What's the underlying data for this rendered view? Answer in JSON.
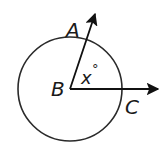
{
  "diagram": {
    "type": "geometry-angle-in-circle",
    "circle": {
      "cx": 70,
      "cy": 89,
      "r": 52,
      "stroke": "#2a2a2a"
    },
    "vertex": {
      "label": "B",
      "x": 70,
      "y": 89
    },
    "rays": [
      {
        "label": "A",
        "to_x": 96,
        "to_y": 12
      },
      {
        "label": "C",
        "to_x": 160,
        "to_y": 89
      }
    ],
    "angle_label": "x°",
    "labels": {
      "A": "A",
      "B": "B",
      "C": "C",
      "angle": "x",
      "degree": "°"
    }
  }
}
